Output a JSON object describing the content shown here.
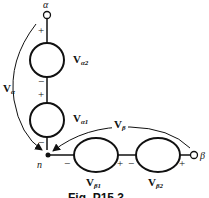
{
  "diagram": {
    "terminals": {
      "alpha": "α",
      "beta": "β",
      "node": "n"
    },
    "sources": [
      {
        "id": "Va2",
        "label_main": "V",
        "label_sub": "α2",
        "top_sign": "+",
        "bottom_sign": "−"
      },
      {
        "id": "Va1",
        "label_main": "V",
        "label_sub": "α1",
        "top_sign": "+",
        "bottom_sign": "−"
      },
      {
        "id": "Vb1",
        "label_main": "V",
        "label_sub": "β1",
        "left_sign": "−",
        "right_sign": "+"
      },
      {
        "id": "Vb2",
        "label_main": "V",
        "label_sub": "β2",
        "left_sign": "−",
        "right_sign": "+"
      }
    ],
    "arrows": [
      {
        "id": "Va",
        "label_main": "V",
        "label_sub": "α"
      },
      {
        "id": "Vb",
        "label_main": "V",
        "label_sub": "β"
      }
    ],
    "caption": "Fig. P15.3"
  }
}
